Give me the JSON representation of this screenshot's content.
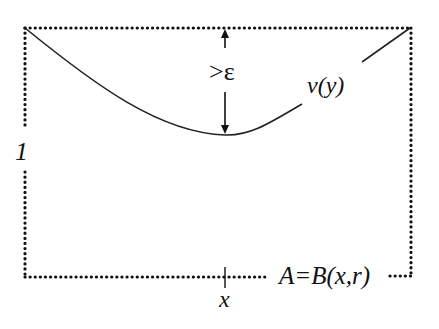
{
  "diagram": {
    "labels": {
      "epsilon": ">ε",
      "curve": "v(y)",
      "left_side": "1",
      "bottom_point": "x",
      "set": "A=B(x,r)"
    },
    "colors": {
      "stroke": "#111111",
      "background": "#ffffff"
    }
  }
}
